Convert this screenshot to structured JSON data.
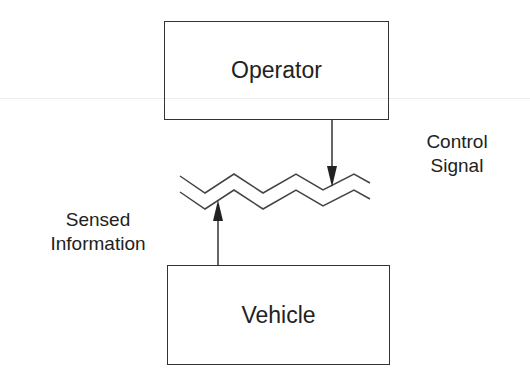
{
  "diagram": {
    "nodes": {
      "operator": {
        "label": "Operator"
      },
      "vehicle": {
        "label": "Vehicle"
      }
    },
    "edges": {
      "control_signal": {
        "from": "operator",
        "to": "communication-channel",
        "label_line1": "Control",
        "label_line2": "Signal"
      },
      "sensed_information": {
        "from": "vehicle",
        "to": "communication-channel",
        "label_line1": "Sensed",
        "label_line2": "Information"
      }
    },
    "channel": {
      "shape": "double-zigzag"
    },
    "colors": {
      "line": "#333333",
      "text": "#222222",
      "background": "#ffffff"
    }
  }
}
